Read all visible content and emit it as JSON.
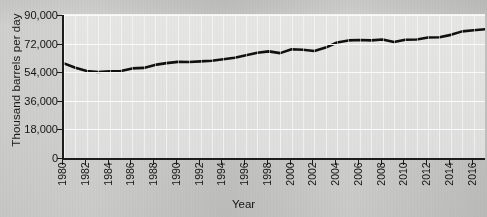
{
  "chart_data": {
    "type": "line",
    "title": "",
    "xlabel": "Year",
    "ylabel": "Thousand barrels per day",
    "xlim": [
      1980,
      2017
    ],
    "ylim": [
      0,
      90000
    ],
    "grid": true,
    "legend": "none",
    "y_ticks": [
      0,
      18000,
      36000,
      54000,
      72000,
      90000
    ],
    "y_tick_labels": [
      "0",
      "18,000",
      "36,000",
      "54,000",
      "72,000",
      "90,000"
    ],
    "x_ticks": [
      1980,
      1982,
      1984,
      1986,
      1988,
      1990,
      1992,
      1994,
      1996,
      1998,
      2000,
      2002,
      2004,
      2006,
      2008,
      2010,
      2012,
      2014,
      2016
    ],
    "x_tick_labels": [
      "1980",
      "1982",
      "1984",
      "1986",
      "1988",
      "1990",
      "1992",
      "1994",
      "1996",
      "1998",
      "2000",
      "2002",
      "2004",
      "2006",
      "2008",
      "2010",
      "2012",
      "2014",
      "2016"
    ],
    "line_color": "#101010",
    "series": [
      {
        "name": "World oil production",
        "x": [
          1980,
          1981,
          1982,
          1983,
          1984,
          1985,
          1986,
          1987,
          1988,
          1989,
          1990,
          1991,
          1992,
          1993,
          1994,
          1995,
          1996,
          1997,
          1998,
          1999,
          2000,
          2001,
          2002,
          2003,
          2004,
          2005,
          2006,
          2007,
          2008,
          2009,
          2010,
          2011,
          2012,
          2013,
          2014,
          2015,
          2016,
          2017
        ],
        "values": [
          59500,
          56800,
          54800,
          54100,
          54600,
          54700,
          56400,
          56700,
          58600,
          59700,
          60500,
          60400,
          60800,
          61200,
          62100,
          63100,
          64700,
          66200,
          67100,
          66000,
          68400,
          68100,
          67300,
          69500,
          72700,
          74000,
          74300,
          74000,
          74600,
          73000,
          74400,
          74600,
          75800,
          76000,
          77500,
          79700,
          80400,
          81000
        ]
      }
    ],
    "note_series_scaled": "values plotted against left axis in thousand barrels per day"
  },
  "axes": {
    "y_title": "Thousand barrels per day",
    "x_title": "Year"
  }
}
